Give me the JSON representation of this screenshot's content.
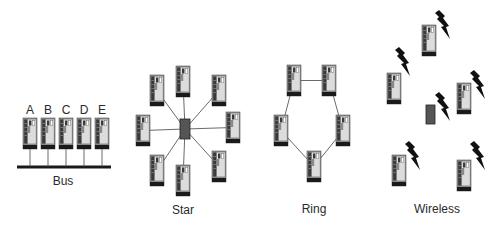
{
  "diagram": {
    "colors": {
      "computer_case": "#8a8a8a",
      "computer_stripe": "#3a3a3a",
      "computer_panel": "#dcdcdc",
      "computer_base": "#1a1a1a",
      "hub": "#555555",
      "line": "#444444",
      "bolt": "#111111",
      "text": "#2a2a2a"
    },
    "topologies": [
      {
        "id": "bus",
        "label": "Bus",
        "nodes": [
          {
            "label": "A",
            "x": 23,
            "y": 118
          },
          {
            "label": "B",
            "x": 41,
            "y": 118
          },
          {
            "label": "C",
            "x": 59,
            "y": 118
          },
          {
            "label": "D",
            "x": 77,
            "y": 118
          },
          {
            "label": "E",
            "x": 95,
            "y": 118
          }
        ]
      },
      {
        "id": "star",
        "label": "Star",
        "hub": {
          "x": 180,
          "y": 119,
          "w": 10,
          "h": 20
        },
        "nodes": [
          {
            "x": 176,
            "y": 66
          },
          {
            "x": 212,
            "y": 75
          },
          {
            "x": 226,
            "y": 112
          },
          {
            "x": 212,
            "y": 151
          },
          {
            "x": 176,
            "y": 165
          },
          {
            "x": 150,
            "y": 155
          },
          {
            "x": 136,
            "y": 115
          },
          {
            "x": 150,
            "y": 75
          }
        ]
      },
      {
        "id": "ring",
        "label": "Ring",
        "nodes": [
          {
            "x": 287,
            "y": 65
          },
          {
            "x": 322,
            "y": 65
          },
          {
            "x": 336,
            "y": 115
          },
          {
            "x": 307,
            "y": 151
          },
          {
            "x": 274,
            "y": 115
          }
        ]
      },
      {
        "id": "wireless",
        "label": "Wireless",
        "access_point": {
          "x": 426,
          "y": 105,
          "w": 9,
          "h": 19
        },
        "nodes": [
          {
            "x": 422,
            "y": 25,
            "bolt": {
              "x": 435,
              "y": 10
            }
          },
          {
            "x": 387,
            "y": 73,
            "bolt": {
              "x": 395,
              "y": 47
            }
          },
          {
            "x": 457,
            "y": 83,
            "bolt": {
              "x": 470,
              "y": 70
            }
          },
          {
            "x": 392,
            "y": 155,
            "bolt": {
              "x": 405,
              "y": 141
            }
          },
          {
            "x": 457,
            "y": 160,
            "bolt": {
              "x": 470,
              "y": 141
            }
          }
        ],
        "ap_bolt": {
          "x": 435,
          "y": 92
        }
      }
    ]
  }
}
